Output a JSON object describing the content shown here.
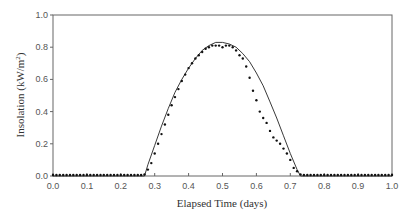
{
  "chart_data": {
    "type": "line",
    "title": "",
    "xlabel": "Elapsed Time  (days)",
    "ylabel": "Insolation  (kW/m²)",
    "ylabel_main": "Insolation  (kW/m",
    "ylabel_sup": "2",
    "ylabel_end": ")",
    "xlim": [
      0.0,
      1.0
    ],
    "ylim": [
      0.0,
      1.0
    ],
    "x_ticks": [
      "0.0",
      "0.1",
      "0.2",
      "0.3",
      "0.4",
      "0.5",
      "0.6",
      "0.7",
      "0.8",
      "0.9",
      "1.0"
    ],
    "y_ticks": [
      "0.0",
      "0.2",
      "0.4",
      "0.6",
      "0.8",
      "1.0"
    ],
    "grid": false,
    "legend": null,
    "series": [
      {
        "name": "model",
        "style": "solid-line",
        "x": [
          0.0,
          0.27,
          0.28,
          0.3,
          0.32,
          0.34,
          0.36,
          0.38,
          0.4,
          0.42,
          0.44,
          0.46,
          0.48,
          0.5,
          0.52,
          0.54,
          0.56,
          0.58,
          0.6,
          0.62,
          0.64,
          0.66,
          0.68,
          0.7,
          0.72,
          0.73,
          1.0
        ],
        "values": [
          0.0,
          0.0,
          0.07,
          0.19,
          0.31,
          0.42,
          0.52,
          0.6,
          0.67,
          0.73,
          0.78,
          0.81,
          0.83,
          0.83,
          0.82,
          0.8,
          0.76,
          0.71,
          0.64,
          0.56,
          0.46,
          0.36,
          0.25,
          0.14,
          0.04,
          0.0,
          0.0
        ]
      },
      {
        "name": "measured",
        "style": "dots",
        "x": [
          0.0,
          0.01,
          0.02,
          0.03,
          0.04,
          0.05,
          0.06,
          0.07,
          0.08,
          0.09,
          0.1,
          0.11,
          0.12,
          0.13,
          0.14,
          0.15,
          0.16,
          0.17,
          0.18,
          0.19,
          0.2,
          0.21,
          0.22,
          0.23,
          0.24,
          0.25,
          0.26,
          0.27,
          0.28,
          0.29,
          0.3,
          0.31,
          0.32,
          0.33,
          0.34,
          0.35,
          0.36,
          0.37,
          0.38,
          0.39,
          0.4,
          0.41,
          0.42,
          0.43,
          0.44,
          0.45,
          0.46,
          0.47,
          0.48,
          0.49,
          0.5,
          0.51,
          0.52,
          0.53,
          0.54,
          0.55,
          0.56,
          0.57,
          0.58,
          0.59,
          0.6,
          0.61,
          0.62,
          0.63,
          0.64,
          0.65,
          0.66,
          0.67,
          0.68,
          0.69,
          0.7,
          0.71,
          0.72,
          0.73,
          0.74,
          0.75,
          0.76,
          0.77,
          0.78,
          0.79,
          0.8,
          0.81,
          0.82,
          0.83,
          0.84,
          0.85,
          0.86,
          0.87,
          0.88,
          0.89,
          0.9,
          0.91,
          0.92,
          0.93,
          0.94,
          0.95,
          0.96,
          0.97,
          0.98,
          0.99,
          1.0
        ],
        "values": [
          0,
          0,
          0,
          0,
          0,
          0,
          0,
          0,
          0,
          0,
          0,
          0,
          0,
          0,
          0,
          0,
          0,
          0,
          0,
          0,
          0,
          0,
          0,
          0,
          0,
          0,
          0,
          0.01,
          0.04,
          0.08,
          0.14,
          0.2,
          0.26,
          0.32,
          0.38,
          0.44,
          0.49,
          0.54,
          0.59,
          0.63,
          0.67,
          0.7,
          0.73,
          0.75,
          0.77,
          0.79,
          0.8,
          0.81,
          0.81,
          0.81,
          0.8,
          0.81,
          0.81,
          0.8,
          0.78,
          0.75,
          0.73,
          0.68,
          0.61,
          0.53,
          0.47,
          0.4,
          0.36,
          0.33,
          0.28,
          0.24,
          0.22,
          0.2,
          0.17,
          0.14,
          0.1,
          0.05,
          0.03,
          0.01,
          0,
          0,
          0,
          0,
          0,
          0,
          0,
          0,
          0,
          0,
          0,
          0,
          0,
          0,
          0,
          0,
          0,
          0,
          0,
          0,
          0,
          0,
          0,
          0,
          0,
          0,
          0
        ]
      }
    ]
  }
}
